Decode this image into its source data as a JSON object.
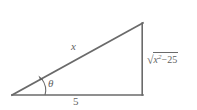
{
  "figure": {
    "type": "right-triangle-diagram",
    "background_color": "#ffffff",
    "stroke_color": "#6a6a6a",
    "text_color": "#5f5f5f",
    "vertices": {
      "left": [
        12,
        95
      ],
      "top_right": [
        143,
        23
      ],
      "bottom_right": [
        143,
        95
      ]
    },
    "labels": {
      "hypotenuse": "x",
      "base": "5",
      "angle": "θ",
      "vertical_radical_sign": "√",
      "vertical_radicand_variable": "x",
      "vertical_radicand_exponent": "2",
      "vertical_radicand_operator": "−",
      "vertical_radicand_constant": "25"
    },
    "icons": {
      "angle_arc": "angle-arc-icon",
      "arrow_head": "arrowhead-icon"
    }
  }
}
